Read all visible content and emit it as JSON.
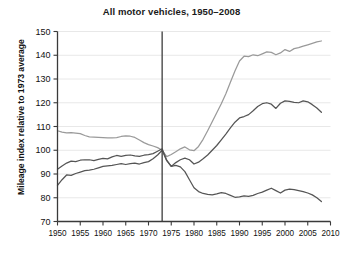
{
  "chart_data": {
    "type": "line",
    "title": "All motor vehicles, 1950–2008",
    "xlabel": "",
    "ylabel": "Mileage index relative to 1973 average",
    "xlim": [
      1950,
      2010
    ],
    "ylim": [
      70,
      150
    ],
    "xticks": [
      1950,
      1955,
      1960,
      1965,
      1970,
      1975,
      1980,
      1985,
      1990,
      1995,
      2000,
      2005,
      2010
    ],
    "yticks": [
      70,
      80,
      90,
      100,
      110,
      120,
      130,
      140,
      150
    ],
    "grid": "horizontal",
    "legend": "none",
    "annotations": [
      {
        "type": "vertical-reference-line",
        "x": 1973,
        "label": "1973 reference year"
      }
    ],
    "series": [
      {
        "name": "series-upper",
        "color": "#9a9a9a",
        "x": [
          1950,
          1951,
          1952,
          1953,
          1954,
          1955,
          1956,
          1957,
          1958,
          1959,
          1960,
          1961,
          1962,
          1963,
          1964,
          1965,
          1966,
          1967,
          1968,
          1969,
          1970,
          1971,
          1972,
          1973,
          1974,
          1975,
          1976,
          1977,
          1978,
          1979,
          1980,
          1981,
          1982,
          1983,
          1984,
          1985,
          1986,
          1987,
          1988,
          1989,
          1990,
          1991,
          1992,
          1993,
          1994,
          1995,
          1996,
          1997,
          1998,
          1999,
          2000,
          2001,
          2002,
          2003,
          2004,
          2005,
          2006,
          2007,
          2008
        ],
        "values": [
          108.2,
          107.6,
          107.3,
          107.4,
          107.2,
          107.0,
          106.2,
          105.6,
          105.5,
          105.4,
          105.3,
          105.2,
          105.2,
          105.3,
          105.8,
          106.1,
          105.9,
          105.4,
          104.3,
          103.2,
          102.4,
          101.8,
          101.1,
          100.0,
          97.3,
          98.2,
          99.4,
          100.6,
          101.4,
          100.2,
          99.8,
          101.6,
          104.6,
          108.2,
          112.0,
          115.8,
          119.6,
          123.8,
          128.6,
          133.4,
          137.6,
          139.6,
          139.4,
          140.2,
          139.8,
          140.6,
          141.4,
          141.2,
          140.2,
          141.0,
          142.4,
          141.6,
          142.8,
          143.2,
          143.8,
          144.4,
          145.0,
          145.6,
          146.0
        ]
      },
      {
        "name": "series-middle",
        "color": "#555555",
        "x": [
          1950,
          1951,
          1952,
          1953,
          1954,
          1955,
          1956,
          1957,
          1958,
          1959,
          1960,
          1961,
          1962,
          1963,
          1964,
          1965,
          1966,
          1967,
          1968,
          1969,
          1970,
          1971,
          1972,
          1973,
          1974,
          1975,
          1976,
          1977,
          1978,
          1979,
          1980,
          1981,
          1982,
          1983,
          1984,
          1985,
          1986,
          1987,
          1988,
          1989,
          1990,
          1991,
          1992,
          1993,
          1994,
          1995,
          1996,
          1997,
          1998,
          1999,
          2000,
          2001,
          2002,
          2003,
          2004,
          2005,
          2006,
          2007,
          2008
        ],
        "values": [
          92.0,
          93.4,
          94.6,
          95.4,
          95.2,
          95.8,
          96.0,
          96.0,
          95.6,
          96.2,
          96.6,
          96.4,
          97.2,
          97.8,
          97.4,
          97.8,
          98.0,
          97.6,
          97.4,
          97.9,
          98.2,
          98.6,
          99.6,
          100.6,
          95.8,
          93.2,
          94.8,
          96.0,
          96.7,
          96.0,
          94.2,
          95.0,
          96.4,
          98.0,
          100.0,
          102.0,
          104.4,
          106.8,
          109.4,
          111.8,
          113.6,
          114.2,
          115.0,
          116.6,
          118.4,
          119.6,
          120.0,
          119.4,
          117.6,
          119.8,
          120.8,
          120.6,
          120.2,
          120.0,
          120.8,
          120.4,
          119.2,
          117.8,
          116.0
        ]
      },
      {
        "name": "series-lower",
        "color": "#555555",
        "x": [
          1950,
          1951,
          1952,
          1953,
          1954,
          1955,
          1956,
          1957,
          1958,
          1959,
          1960,
          1961,
          1962,
          1963,
          1964,
          1965,
          1966,
          1967,
          1968,
          1969,
          1970,
          1971,
          1972,
          1973,
          1974,
          1975,
          1976,
          1977,
          1978,
          1979,
          1980,
          1981,
          1982,
          1983,
          1984,
          1985,
          1986,
          1987,
          1988,
          1989,
          1990,
          1991,
          1992,
          1993,
          1994,
          1995,
          1996,
          1997,
          1998,
          1999,
          2000,
          2001,
          2002,
          2003,
          2004,
          2005,
          2006,
          2007,
          2008
        ],
        "values": [
          85.2,
          87.6,
          89.6,
          89.4,
          90.2,
          90.8,
          91.4,
          91.6,
          92.0,
          92.6,
          93.2,
          93.4,
          93.6,
          94.0,
          94.4,
          94.0,
          94.4,
          94.6,
          94.2,
          94.8,
          95.2,
          96.4,
          98.0,
          100.0,
          95.6,
          93.2,
          93.6,
          93.0,
          91.0,
          87.6,
          84.2,
          82.6,
          81.8,
          81.4,
          81.2,
          81.6,
          82.2,
          81.8,
          81.0,
          80.2,
          80.4,
          80.8,
          80.6,
          81.0,
          81.8,
          82.4,
          83.2,
          84.0,
          83.0,
          82.0,
          83.2,
          83.6,
          83.4,
          83.0,
          82.6,
          82.0,
          81.2,
          80.0,
          78.4
        ]
      }
    ]
  }
}
